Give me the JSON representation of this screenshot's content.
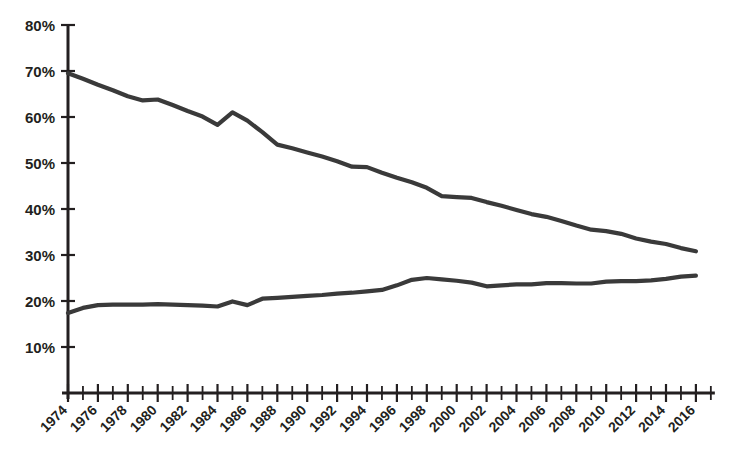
{
  "chart_data": {
    "type": "line",
    "title": "",
    "subtitle": "",
    "xlabel": "",
    "ylabel": "",
    "xlim": [
      1974,
      2017
    ],
    "ylim": [
      0,
      80
    ],
    "y_tick_labels": [
      "10%",
      "20%",
      "30%",
      "40%",
      "50%",
      "60%",
      "70%",
      "80%"
    ],
    "y_tick_values": [
      10,
      20,
      30,
      40,
      50,
      60,
      70,
      80
    ],
    "x_tick_labels": [
      "1974",
      "1976",
      "1978",
      "1980",
      "1982",
      "1984",
      "1986",
      "1988",
      "1990",
      "1992",
      "1994",
      "1996",
      "1998",
      "2000",
      "2002",
      "2004",
      "2006",
      "2008",
      "2010",
      "2012",
      "2014",
      "2016"
    ],
    "x_tick_values": [
      1974,
      1976,
      1978,
      1980,
      1982,
      1984,
      1986,
      1988,
      1990,
      1992,
      1994,
      1996,
      1998,
      2000,
      2002,
      2004,
      2006,
      2008,
      2010,
      2012,
      2014,
      2016
    ],
    "minor_tick_interval": 1,
    "grid": false,
    "legend": "none",
    "line_color": "#3a3a3a",
    "axis_color": "#231f20",
    "x": [
      1974,
      1975,
      1976,
      1977,
      1978,
      1979,
      1980,
      1981,
      1982,
      1983,
      1984,
      1985,
      1986,
      1987,
      1988,
      1989,
      1990,
      1991,
      1992,
      1993,
      1994,
      1995,
      1996,
      1997,
      1998,
      1999,
      2000,
      2001,
      2002,
      2003,
      2004,
      2005,
      2006,
      2007,
      2008,
      2009,
      2010,
      2011,
      2012,
      2013,
      2014,
      2015,
      2016
    ],
    "series": [
      {
        "name": "Upper series",
        "values": [
          69.5,
          68.3,
          67.0,
          65.8,
          64.5,
          63.6,
          63.8,
          62.6,
          61.3,
          60.1,
          58.3,
          61.0,
          59.2,
          56.7,
          54.0,
          53.2,
          52.3,
          51.4,
          50.4,
          49.2,
          49.1,
          47.9,
          46.8,
          45.8,
          44.6,
          42.8,
          42.6,
          42.4,
          41.5,
          40.7,
          39.8,
          38.9,
          38.3,
          37.4,
          36.4,
          35.5,
          35.2,
          34.6,
          33.6,
          32.9,
          32.4,
          31.5,
          30.8
        ]
      },
      {
        "name": "Lower series",
        "values": [
          17.4,
          18.5,
          19.1,
          19.2,
          19.2,
          19.2,
          19.3,
          19.2,
          19.1,
          19.0,
          18.8,
          19.9,
          19.1,
          20.5,
          20.7,
          20.9,
          21.1,
          21.3,
          21.6,
          21.8,
          22.1,
          22.4,
          23.4,
          24.6,
          25.0,
          24.7,
          24.4,
          24.0,
          23.2,
          23.4,
          23.6,
          23.6,
          23.9,
          23.9,
          23.8,
          23.8,
          24.2,
          24.3,
          24.3,
          24.5,
          24.8,
          25.3,
          25.5
        ]
      }
    ]
  }
}
